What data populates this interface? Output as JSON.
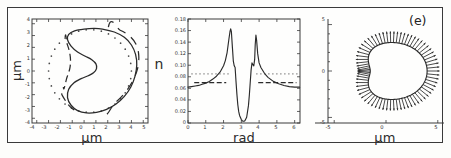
{
  "figure": {
    "panel_label": "(e)",
    "background_color": "#fdfdfb",
    "line_color": "#2b2b2b"
  },
  "panels": [
    {
      "id": "contour",
      "xlabel": "μm",
      "ylabel": "μm",
      "xticks": [
        "-4",
        "-3",
        "-2",
        "-1",
        "0",
        "1",
        "2",
        "3",
        "4",
        "5"
      ],
      "yticks": [
        "-4",
        "-3",
        "-2",
        "-1",
        "0",
        "1",
        "2",
        "3",
        "4"
      ]
    },
    {
      "id": "curvature",
      "xlabel": "rad",
      "ylabel": "n",
      "xticks": [
        "0",
        "1",
        "2",
        "3",
        "4",
        "5",
        "6"
      ],
      "yticks": [
        "0",
        "0.02",
        "0.04",
        "0.06",
        "0.08",
        "0.10",
        "0.12",
        "0.14",
        "0.16",
        "0.18"
      ]
    },
    {
      "id": "normals",
      "xlabel": "μm",
      "ylabel": "",
      "xticks": [
        "-5",
        "0",
        "5"
      ],
      "yticks": [
        "-5",
        "0",
        "5"
      ]
    }
  ],
  "chart_data": [
    {
      "type": "line",
      "id": "contour",
      "title": "",
      "xlabel": "μm",
      "ylabel": "μm",
      "xlim": [
        -4.4,
        5.4
      ],
      "ylim": [
        -4.4,
        4.4
      ],
      "grid": false,
      "legend": "none",
      "series": [
        {
          "name": "measured contour (solid)",
          "style": "solid",
          "closed": true,
          "x": [
            1.55,
            2.55,
            3.4,
            4.0,
            4.35,
            4.45,
            4.3,
            3.95,
            3.4,
            2.7,
            1.9,
            1.05,
            0.2,
            -0.55,
            -1.1,
            -1.4,
            -1.3,
            -0.85,
            -0.25,
            0.35,
            0.8,
            1.05,
            1.0,
            0.65,
            0.1,
            -0.55,
            -1.1,
            -1.4,
            -1.3,
            -0.8,
            0.0,
            0.85
          ],
          "y": [
            3.55,
            3.3,
            2.85,
            2.2,
            1.4,
            0.5,
            -0.45,
            -1.35,
            -2.15,
            -2.8,
            -3.25,
            -3.5,
            -3.55,
            -3.35,
            -2.9,
            -2.25,
            -1.55,
            -1.0,
            -0.65,
            -0.4,
            -0.15,
            0.2,
            0.6,
            0.95,
            1.25,
            1.6,
            2.1,
            2.65,
            3.1,
            3.4,
            3.55,
            3.6
          ]
        },
        {
          "name": "model contour (dashed arcs)",
          "style": "dashed",
          "closed": false,
          "x": [
            -1.6,
            -1.45,
            -1.25,
            -1.15,
            -1.2,
            -1.45,
            -1.75
          ],
          "y": [
            2.85,
            2.35,
            1.7,
            1.0,
            0.25,
            -0.55,
            -1.35
          ]
        },
        {
          "name": "reference circle (dotted)",
          "style": "dotted",
          "closed": true,
          "center": [
            0.5,
            0.0
          ],
          "radius_x": 3.5,
          "radius_y": 3.5,
          "n_points": 34
        }
      ]
    },
    {
      "type": "line",
      "id": "curvature",
      "title": "",
      "xlabel": "rad",
      "ylabel": "n",
      "xlim": [
        0,
        6.3
      ],
      "ylim": [
        0,
        0.18
      ],
      "grid": false,
      "legend": "none",
      "series": [
        {
          "name": "curvature n(θ) (solid)",
          "style": "solid",
          "x": [
            0.0,
            0.2,
            0.4,
            0.6,
            0.8,
            1.0,
            1.2,
            1.4,
            1.6,
            1.8,
            2.0,
            2.1,
            2.2,
            2.3,
            2.36,
            2.4,
            2.44,
            2.5,
            2.55,
            2.6,
            2.65,
            2.7,
            2.75,
            2.8,
            2.85,
            2.9,
            3.0,
            3.05,
            3.1,
            3.15,
            3.2,
            3.3,
            3.4,
            3.45,
            3.5,
            3.55,
            3.6,
            3.65,
            3.7,
            3.75,
            3.78,
            3.82,
            3.86,
            3.92,
            4.0,
            4.1,
            4.3,
            4.5,
            4.8,
            5.1,
            5.4,
            5.7,
            6.0,
            6.28
          ],
          "y": [
            0.062,
            0.063,
            0.064,
            0.065,
            0.067,
            0.069,
            0.072,
            0.076,
            0.081,
            0.088,
            0.099,
            0.108,
            0.122,
            0.145,
            0.158,
            0.163,
            0.158,
            0.13,
            0.107,
            0.099,
            0.096,
            0.072,
            0.05,
            0.032,
            0.02,
            0.013,
            0.006,
            0.004,
            0.003,
            0.003,
            0.004,
            0.01,
            0.03,
            0.048,
            0.07,
            0.092,
            0.104,
            0.101,
            0.099,
            0.11,
            0.135,
            0.152,
            0.143,
            0.12,
            0.104,
            0.096,
            0.086,
            0.079,
            0.072,
            0.068,
            0.065,
            0.063,
            0.062,
            0.062
          ]
        },
        {
          "name": "baseline level (dashed)",
          "style": "dashed",
          "y_level": 0.07,
          "x_segments": [
            [
              0.35,
              2.15
            ],
            [
              3.95,
              6.1
            ]
          ]
        },
        {
          "name": "upper level (dotted)",
          "style": "dotted",
          "y_level": 0.085,
          "x_segments": [
            [
              0.2,
              2.35
            ],
            [
              3.85,
              6.2
            ]
          ]
        }
      ]
    },
    {
      "type": "quiver",
      "id": "normals",
      "title": "(e)",
      "xlabel": "μm",
      "ylabel": "",
      "xlim": [
        -5.6,
        5.6
      ],
      "ylim": [
        -5.6,
        5.6
      ],
      "grid": false,
      "legend": "none",
      "series": [
        {
          "name": "outward normal vectors on contour",
          "style": "arrows",
          "n_arrows": 72,
          "arrow_length": 1.2,
          "contour_center": [
            0.3,
            0.0
          ],
          "contour_type": "cardioid-like bean"
        }
      ]
    }
  ]
}
